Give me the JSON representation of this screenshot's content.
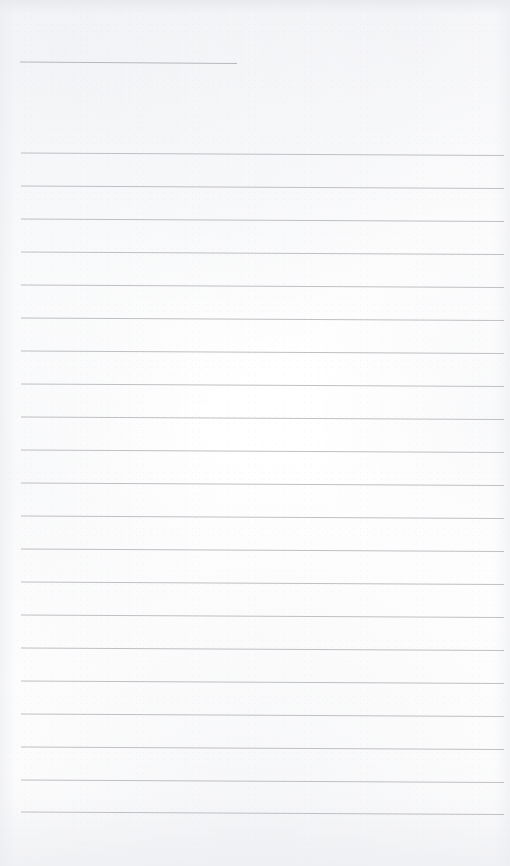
{
  "document": {
    "kind": "scanned-lined-page",
    "title": "",
    "page_label": "",
    "body_text": "",
    "caption": "Blank ruled notebook page (scan)",
    "width_px": 510,
    "height_px": 866
  },
  "palette": {
    "paper": "#fefefe",
    "rule_line": "#b9b9be",
    "header_rule_line": "#b4b4ba",
    "edge_shadow": "#e9eaee"
  },
  "layout": {
    "left_margin_px": 21,
    "right_edge_px": 504,
    "first_full_rule_y_px": 153,
    "rule_spacing_px": 33,
    "rule_thickness_px": 1,
    "slope_drop_px": 2.5,
    "bottom_margin_px": 53
  },
  "header_rule": {
    "name": "header-underline",
    "y_px": 62,
    "x_start_px": 20,
    "x_end_px": 237,
    "slope_drop_px": 1.5,
    "written_text": ""
  },
  "rules": [
    {
      "index": 1,
      "y_px": 153,
      "x_start_px": 21,
      "x_end_px": 504,
      "written_text": ""
    },
    {
      "index": 2,
      "y_px": 186,
      "x_start_px": 21,
      "x_end_px": 504,
      "written_text": ""
    },
    {
      "index": 3,
      "y_px": 219,
      "x_start_px": 21,
      "x_end_px": 504,
      "written_text": ""
    },
    {
      "index": 4,
      "y_px": 252,
      "x_start_px": 21,
      "x_end_px": 504,
      "written_text": ""
    },
    {
      "index": 5,
      "y_px": 285,
      "x_start_px": 21,
      "x_end_px": 504,
      "written_text": ""
    },
    {
      "index": 6,
      "y_px": 318,
      "x_start_px": 21,
      "x_end_px": 504,
      "written_text": ""
    },
    {
      "index": 7,
      "y_px": 351,
      "x_start_px": 21,
      "x_end_px": 504,
      "written_text": ""
    },
    {
      "index": 8,
      "y_px": 384,
      "x_start_px": 21,
      "x_end_px": 504,
      "written_text": ""
    },
    {
      "index": 9,
      "y_px": 417,
      "x_start_px": 21,
      "x_end_px": 504,
      "written_text": ""
    },
    {
      "index": 10,
      "y_px": 450,
      "x_start_px": 21,
      "x_end_px": 504,
      "written_text": ""
    },
    {
      "index": 11,
      "y_px": 483,
      "x_start_px": 21,
      "x_end_px": 504,
      "written_text": ""
    },
    {
      "index": 12,
      "y_px": 516,
      "x_start_px": 21,
      "x_end_px": 504,
      "written_text": ""
    },
    {
      "index": 13,
      "y_px": 549,
      "x_start_px": 21,
      "x_end_px": 504,
      "written_text": ""
    },
    {
      "index": 14,
      "y_px": 582,
      "x_start_px": 21,
      "x_end_px": 504,
      "written_text": ""
    },
    {
      "index": 15,
      "y_px": 615,
      "x_start_px": 21,
      "x_end_px": 504,
      "written_text": ""
    },
    {
      "index": 16,
      "y_px": 648,
      "x_start_px": 21,
      "x_end_px": 504,
      "written_text": ""
    },
    {
      "index": 17,
      "y_px": 681,
      "x_start_px": 21,
      "x_end_px": 504,
      "written_text": ""
    },
    {
      "index": 18,
      "y_px": 714,
      "x_start_px": 21,
      "x_end_px": 504,
      "written_text": ""
    },
    {
      "index": 19,
      "y_px": 747,
      "x_start_px": 21,
      "x_end_px": 504,
      "written_text": ""
    },
    {
      "index": 20,
      "y_px": 780,
      "x_start_px": 21,
      "x_end_px": 504,
      "written_text": ""
    },
    {
      "index": 21,
      "y_px": 812,
      "x_start_px": 21,
      "x_end_px": 504,
      "written_text": ""
    }
  ]
}
